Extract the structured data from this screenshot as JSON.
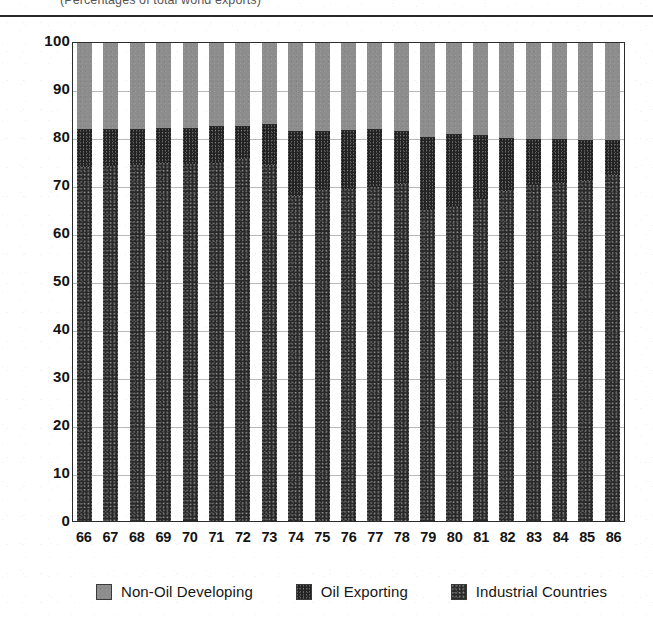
{
  "chart_data": {
    "type": "bar",
    "subtype": "stacked-100-percent",
    "title": "",
    "subtitle": "(Percentages of total world exports)",
    "xlabel": "",
    "ylabel": "",
    "ylim": [
      0,
      100
    ],
    "ytick_values": [
      100,
      90,
      80,
      70,
      60,
      50,
      40,
      30,
      20,
      10,
      0
    ],
    "ytick_labels": [
      "100",
      "90",
      "80",
      "70",
      "60",
      "50",
      "40",
      "30",
      "20",
      "10",
      "0"
    ],
    "grid": true,
    "grid_axis": "y",
    "legend_position": "bottom",
    "categories": [
      "66",
      "67",
      "68",
      "69",
      "70",
      "71",
      "72",
      "73",
      "74",
      "75",
      "76",
      "77",
      "78",
      "79",
      "80",
      "81",
      "82",
      "83",
      "84",
      "85",
      "86"
    ],
    "series": [
      {
        "name": "Industrial Countries",
        "color": "#282828",
        "pattern": "dark-speckle",
        "values": [
          74.0,
          74.2,
          74.5,
          74.8,
          74.6,
          74.9,
          75.8,
          74.4,
          68.0,
          69.2,
          69.5,
          69.8,
          70.4,
          65.0,
          65.6,
          67.4,
          69.0,
          70.2,
          70.8,
          71.2,
          72.4
        ]
      },
      {
        "name": "Oil Exporting",
        "color": "#232323",
        "pattern": "dense-speckle",
        "values": [
          7.8,
          7.6,
          7.4,
          7.2,
          7.4,
          7.5,
          6.6,
          8.4,
          13.4,
          12.2,
          12.1,
          12.0,
          11.0,
          15.2,
          15.2,
          13.2,
          11.0,
          9.6,
          9.0,
          8.4,
          7.0
        ]
      },
      {
        "name": "Non-Oil Developing",
        "color": "#8d8d8d",
        "pattern": "solid-gray",
        "values": [
          18.2,
          18.2,
          18.1,
          18.0,
          18.0,
          17.6,
          17.6,
          17.2,
          18.6,
          18.6,
          18.4,
          18.2,
          18.6,
          19.8,
          19.2,
          19.4,
          20.0,
          20.2,
          20.2,
          20.4,
          20.6
        ]
      }
    ],
    "segment_tops": {
      "note": "cumulative top of the dark (Industrial + Oil Exporting) stack, percent of 100",
      "values": [
        81.8,
        81.8,
        81.9,
        82.0,
        82.0,
        82.4,
        82.4,
        82.8,
        81.4,
        81.4,
        81.6,
        81.8,
        81.4,
        80.2,
        80.8,
        80.6,
        80.0,
        79.8,
        79.8,
        79.6,
        79.4
      ]
    }
  },
  "legend": {
    "items": [
      {
        "label": "Non-Oil Developing",
        "swatch": "legend-swatch-non-oil-developing"
      },
      {
        "label": "Oil Exporting",
        "swatch": "legend-swatch-oil-exporting"
      },
      {
        "label": "Industrial Countries",
        "swatch": "legend-swatch-industrial-countries"
      }
    ]
  }
}
